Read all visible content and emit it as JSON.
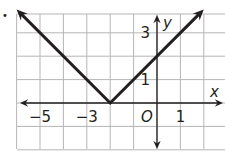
{
  "problem_marker": "•",
  "chart_data": {
    "type": "line",
    "title": "",
    "function": "y = |x + 2|",
    "xlabel": "x",
    "ylabel": "y",
    "origin_label": "O",
    "xlim": [
      -6.7,
      2.9
    ],
    "ylim": [
      -2.0,
      4.0
    ],
    "grid": true,
    "legend": null,
    "x_tick_labels": [
      {
        "value": -5,
        "label": "−5"
      },
      {
        "value": -3,
        "label": "−3"
      },
      {
        "value": 1,
        "label": "1"
      }
    ],
    "y_tick_labels": [
      {
        "value": 1,
        "label": "1"
      },
      {
        "value": 3,
        "label": "3"
      }
    ],
    "series": [
      {
        "name": "absolute value graph",
        "points": [
          [
            -6,
            4
          ],
          [
            -2,
            0
          ],
          [
            2,
            4
          ]
        ],
        "arrows_at_ends": true,
        "color": "#231f20"
      }
    ],
    "vertex": [
      -2,
      0
    ]
  },
  "colors": {
    "grid": "#b5b5b5",
    "axis": "#231f20",
    "line": "#231f20"
  }
}
